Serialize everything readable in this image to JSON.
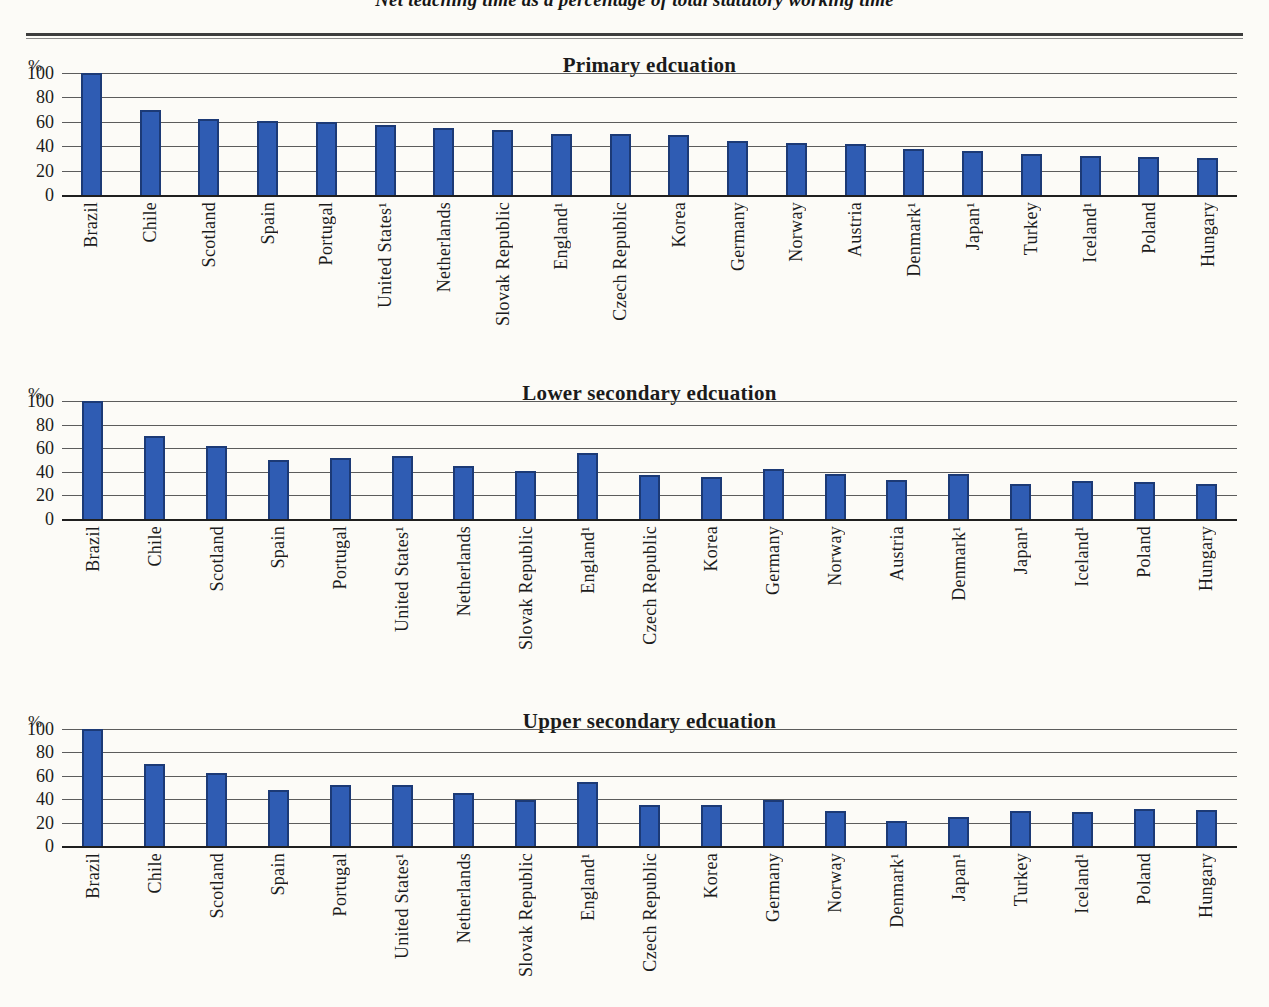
{
  "document": {
    "subtitle": "Net teaching time as a percentage of total statutory working time"
  },
  "colors": {
    "bar_fill": "#2f5cb3",
    "bar_border": "#1c3a76",
    "grid_line": "#5c5c5c",
    "axis_line": "#1f1f1f",
    "paper": "#fcfbf7",
    "text": "#1b1b1b"
  },
  "chart_data": [
    {
      "type": "bar",
      "title": "Primary edcuation",
      "ylabel": "%",
      "ylim": [
        0,
        100
      ],
      "yticks": [
        0,
        20,
        40,
        60,
        80,
        100
      ],
      "grid": true,
      "legend": "none",
      "categories": [
        "Brazil",
        "Chile",
        "Scotland",
        "Spain",
        "Portugal",
        "United States¹",
        "Netherlands",
        "Slovak Republic",
        "England¹",
        "Czech Republic",
        "Korea",
        "Germany",
        "Norway",
        "Austria",
        "Denmark¹",
        "Japan¹",
        "Turkey",
        "Iceland¹",
        "Poland",
        "Hungary"
      ],
      "values": [
        100,
        70,
        62,
        61,
        60,
        57,
        55,
        53,
        50,
        50,
        49,
        44,
        43,
        42,
        38,
        36,
        34,
        32,
        31,
        30
      ]
    },
    {
      "type": "bar",
      "title": "Lower secondary edcuation",
      "ylabel": "%",
      "ylim": [
        0,
        100
      ],
      "yticks": [
        0,
        20,
        40,
        60,
        80,
        100
      ],
      "grid": true,
      "legend": "none",
      "categories": [
        "Brazil",
        "Chile",
        "Scotland",
        "Spain",
        "Portugal",
        "United States¹",
        "Netherlands",
        "Slovak Republic",
        "England¹",
        "Czech Republic",
        "Korea",
        "Germany",
        "Norway",
        "Austria",
        "Denmark¹",
        "Japan¹",
        "Iceland¹",
        "Poland",
        "Hungary"
      ],
      "values": [
        100,
        70,
        62,
        50,
        52,
        53,
        45,
        41,
        56,
        37,
        36,
        42,
        38,
        33,
        38,
        30,
        32,
        31,
        30
      ]
    },
    {
      "type": "bar",
      "title": "Upper secondary edcuation",
      "ylabel": "%",
      "ylim": [
        0,
        100
      ],
      "yticks": [
        0,
        20,
        40,
        60,
        80,
        100
      ],
      "grid": true,
      "legend": "none",
      "categories": [
        "Brazil",
        "Chile",
        "Scotland",
        "Spain",
        "Portugal",
        "United States¹",
        "Netherlands",
        "Slovak Republic",
        "England¹",
        "Czech Republic",
        "Korea",
        "Germany",
        "Norway",
        "Denmark¹",
        "Japan¹",
        "Turkey",
        "Iceland¹",
        "Poland",
        "Hungary"
      ],
      "values": [
        100,
        70,
        62,
        48,
        52,
        52,
        45,
        39,
        55,
        35,
        35,
        39,
        30,
        21,
        25,
        30,
        29,
        32,
        31
      ]
    }
  ]
}
